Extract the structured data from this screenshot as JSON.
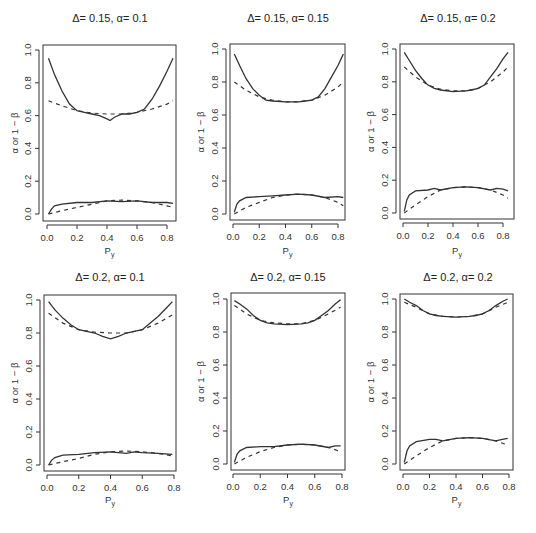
{
  "figure": {
    "layout": "2x3 grid of line plots",
    "line_color": "#333333",
    "background": "#ffffff"
  },
  "chart_data": [
    {
      "type": "line",
      "title": "Δ= 0.15, α= 0.1",
      "xlabel": "P_y",
      "ylabel": "α or 1 − β",
      "xlim": [
        0.0,
        0.85
      ],
      "ylim": [
        0.0,
        1.0
      ],
      "xticks": [
        "0.0",
        "0.2",
        "0.4",
        "0.6",
        "0.8"
      ],
      "yticks": [
        "0.0",
        "0.2",
        "0.4",
        "0.6",
        "0.8",
        "1.0"
      ],
      "grid": false,
      "series": [
        {
          "name": "power (solid)",
          "style": "solid",
          "x": [
            0.01,
            0.05,
            0.1,
            0.15,
            0.2,
            0.25,
            0.3,
            0.35,
            0.4,
            0.42,
            0.45,
            0.5,
            0.55,
            0.6,
            0.65,
            0.7,
            0.75,
            0.8,
            0.84
          ],
          "y": [
            0.95,
            0.85,
            0.75,
            0.67,
            0.63,
            0.62,
            0.61,
            0.6,
            0.58,
            0.57,
            0.59,
            0.61,
            0.61,
            0.62,
            0.64,
            0.7,
            0.78,
            0.87,
            0.95
          ]
        },
        {
          "name": "power (dashed)",
          "style": "dashed",
          "x": [
            0.01,
            0.1,
            0.2,
            0.3,
            0.4,
            0.5,
            0.6,
            0.7,
            0.8,
            0.84
          ],
          "y": [
            0.69,
            0.66,
            0.63,
            0.615,
            0.61,
            0.61,
            0.62,
            0.64,
            0.67,
            0.69
          ]
        },
        {
          "name": "type I error (solid)",
          "style": "solid",
          "x": [
            0.01,
            0.03,
            0.05,
            0.1,
            0.2,
            0.3,
            0.4,
            0.5,
            0.6,
            0.7,
            0.8,
            0.84
          ],
          "y": [
            0.0,
            0.03,
            0.05,
            0.06,
            0.07,
            0.07,
            0.08,
            0.075,
            0.08,
            0.07,
            0.07,
            0.065
          ]
        },
        {
          "name": "type I error (dashed)",
          "style": "dashed",
          "x": [
            0.01,
            0.1,
            0.2,
            0.3,
            0.4,
            0.5,
            0.6,
            0.7,
            0.8,
            0.84
          ],
          "y": [
            0.0,
            0.02,
            0.04,
            0.06,
            0.08,
            0.085,
            0.08,
            0.07,
            0.05,
            0.04
          ]
        }
      ]
    },
    {
      "type": "line",
      "title": "Δ= 0.15, α= 0.15",
      "xlabel": "P_y",
      "ylabel": "α or 1 − β",
      "xlim": [
        0.0,
        0.85
      ],
      "ylim": [
        0.0,
        1.0
      ],
      "xticks": [
        "0.0",
        "0.2",
        "0.4",
        "0.6",
        "0.8"
      ],
      "yticks": [
        "0.0",
        "0.2",
        "0.4",
        "0.6",
        "0.8",
        "1.0"
      ],
      "grid": false,
      "series": [
        {
          "name": "power (solid)",
          "style": "solid",
          "x": [
            0.01,
            0.05,
            0.1,
            0.15,
            0.2,
            0.25,
            0.3,
            0.4,
            0.5,
            0.55,
            0.6,
            0.65,
            0.7,
            0.75,
            0.8,
            0.84
          ],
          "y": [
            0.97,
            0.9,
            0.82,
            0.76,
            0.72,
            0.69,
            0.685,
            0.68,
            0.68,
            0.685,
            0.69,
            0.71,
            0.76,
            0.83,
            0.9,
            0.97
          ]
        },
        {
          "name": "power (dashed)",
          "style": "dashed",
          "x": [
            0.01,
            0.1,
            0.2,
            0.3,
            0.4,
            0.5,
            0.6,
            0.7,
            0.8,
            0.84
          ],
          "y": [
            0.8,
            0.75,
            0.71,
            0.69,
            0.68,
            0.68,
            0.69,
            0.72,
            0.77,
            0.8
          ]
        },
        {
          "name": "type I error (solid)",
          "style": "solid",
          "x": [
            0.01,
            0.03,
            0.05,
            0.1,
            0.2,
            0.3,
            0.4,
            0.5,
            0.6,
            0.7,
            0.8,
            0.84
          ],
          "y": [
            0.01,
            0.06,
            0.08,
            0.1,
            0.105,
            0.11,
            0.115,
            0.12,
            0.115,
            0.1,
            0.105,
            0.1
          ]
        },
        {
          "name": "type I error (dashed)",
          "style": "dashed",
          "x": [
            0.01,
            0.1,
            0.2,
            0.3,
            0.4,
            0.5,
            0.6,
            0.7,
            0.8,
            0.84
          ],
          "y": [
            0.0,
            0.04,
            0.07,
            0.1,
            0.115,
            0.12,
            0.115,
            0.1,
            0.07,
            0.05
          ]
        }
      ]
    },
    {
      "type": "line",
      "title": "Δ= 0.15, α= 0.2",
      "xlabel": "P_y",
      "ylabel": "α or 1 − β",
      "xlim": [
        0.0,
        0.85
      ],
      "ylim": [
        0.0,
        1.0
      ],
      "xticks": [
        "0.0",
        "0.2",
        "0.4",
        "0.6",
        "0.8"
      ],
      "yticks": [
        "0.0",
        "0.2",
        "0.4",
        "0.6",
        "0.8",
        "1.0"
      ],
      "grid": false,
      "series": [
        {
          "name": "power (solid)",
          "style": "solid",
          "x": [
            0.01,
            0.05,
            0.1,
            0.15,
            0.2,
            0.25,
            0.3,
            0.4,
            0.5,
            0.55,
            0.6,
            0.65,
            0.7,
            0.75,
            0.8,
            0.84
          ],
          "y": [
            0.98,
            0.93,
            0.87,
            0.82,
            0.78,
            0.76,
            0.75,
            0.74,
            0.745,
            0.75,
            0.76,
            0.78,
            0.83,
            0.88,
            0.94,
            0.98
          ]
        },
        {
          "name": "power (dashed)",
          "style": "dashed",
          "x": [
            0.01,
            0.1,
            0.2,
            0.3,
            0.4,
            0.5,
            0.6,
            0.7,
            0.8,
            0.84
          ],
          "y": [
            0.89,
            0.83,
            0.78,
            0.755,
            0.745,
            0.745,
            0.76,
            0.8,
            0.86,
            0.89
          ]
        },
        {
          "name": "type I error (solid)",
          "style": "solid",
          "x": [
            0.01,
            0.03,
            0.05,
            0.1,
            0.2,
            0.25,
            0.3,
            0.4,
            0.5,
            0.6,
            0.7,
            0.75,
            0.8,
            0.84
          ],
          "y": [
            0.01,
            0.08,
            0.11,
            0.135,
            0.14,
            0.15,
            0.14,
            0.155,
            0.16,
            0.155,
            0.14,
            0.15,
            0.145,
            0.135
          ]
        },
        {
          "name": "type I error (dashed)",
          "style": "dashed",
          "x": [
            0.01,
            0.1,
            0.2,
            0.3,
            0.4,
            0.5,
            0.6,
            0.7,
            0.8,
            0.84
          ],
          "y": [
            0.0,
            0.05,
            0.1,
            0.14,
            0.155,
            0.16,
            0.155,
            0.14,
            0.11,
            0.09
          ]
        }
      ]
    },
    {
      "type": "line",
      "title": "Δ= 0.2, α= 0.1",
      "xlabel": "P_y",
      "ylabel": "α or 1 − β",
      "xlim": [
        0.0,
        0.8
      ],
      "ylim": [
        0.0,
        1.0
      ],
      "xticks": [
        "0.0",
        "0.2",
        "0.4",
        "0.6",
        "0.8"
      ],
      "yticks": [
        "0.0",
        "0.2",
        "0.4",
        "0.6",
        "0.8",
        "1.0"
      ],
      "grid": false,
      "series": [
        {
          "name": "power (solid)",
          "style": "solid",
          "x": [
            0.01,
            0.05,
            0.1,
            0.15,
            0.2,
            0.25,
            0.3,
            0.35,
            0.4,
            0.45,
            0.5,
            0.55,
            0.6,
            0.65,
            0.7,
            0.75,
            0.79
          ],
          "y": [
            0.99,
            0.94,
            0.89,
            0.85,
            0.82,
            0.81,
            0.8,
            0.78,
            0.765,
            0.78,
            0.8,
            0.81,
            0.82,
            0.86,
            0.9,
            0.95,
            0.99
          ]
        },
        {
          "name": "power (dashed)",
          "style": "dashed",
          "x": [
            0.01,
            0.1,
            0.2,
            0.3,
            0.4,
            0.5,
            0.6,
            0.7,
            0.79
          ],
          "y": [
            0.92,
            0.86,
            0.82,
            0.805,
            0.8,
            0.8,
            0.82,
            0.86,
            0.91
          ]
        },
        {
          "name": "type I error (solid)",
          "style": "solid",
          "x": [
            0.01,
            0.03,
            0.05,
            0.1,
            0.2,
            0.3,
            0.4,
            0.5,
            0.55,
            0.6,
            0.7,
            0.79
          ],
          "y": [
            0.0,
            0.03,
            0.045,
            0.06,
            0.065,
            0.075,
            0.08,
            0.07,
            0.08,
            0.075,
            0.07,
            0.065
          ]
        },
        {
          "name": "type I error (dashed)",
          "style": "dashed",
          "x": [
            0.01,
            0.1,
            0.2,
            0.3,
            0.4,
            0.5,
            0.6,
            0.7,
            0.79
          ],
          "y": [
            0.0,
            0.02,
            0.04,
            0.065,
            0.08,
            0.085,
            0.08,
            0.07,
            0.055
          ]
        }
      ]
    },
    {
      "type": "line",
      "title": "Δ= 0.2, α= 0.15",
      "xlabel": "P_y",
      "ylabel": "α or 1 − β",
      "xlim": [
        0.0,
        0.8
      ],
      "ylim": [
        0.0,
        1.0
      ],
      "xticks": [
        "0.0",
        "0.2",
        "0.4",
        "0.6",
        "0.8"
      ],
      "yticks": [
        "0.0",
        "0.2",
        "0.4",
        "0.6",
        "0.8",
        "1.0"
      ],
      "grid": false,
      "series": [
        {
          "name": "power (solid)",
          "style": "solid",
          "x": [
            0.01,
            0.05,
            0.1,
            0.15,
            0.2,
            0.25,
            0.3,
            0.4,
            0.5,
            0.55,
            0.6,
            0.65,
            0.7,
            0.75,
            0.79
          ],
          "y": [
            0.99,
            0.97,
            0.94,
            0.9,
            0.87,
            0.855,
            0.85,
            0.845,
            0.85,
            0.855,
            0.87,
            0.9,
            0.93,
            0.97,
            0.995
          ]
        },
        {
          "name": "power (dashed)",
          "style": "dashed",
          "x": [
            0.01,
            0.1,
            0.2,
            0.3,
            0.4,
            0.5,
            0.6,
            0.7,
            0.79
          ],
          "y": [
            0.96,
            0.91,
            0.87,
            0.855,
            0.85,
            0.85,
            0.87,
            0.91,
            0.95
          ]
        },
        {
          "name": "type I error (solid)",
          "style": "solid",
          "x": [
            0.01,
            0.03,
            0.05,
            0.1,
            0.2,
            0.3,
            0.4,
            0.5,
            0.6,
            0.7,
            0.75,
            0.79
          ],
          "y": [
            0.01,
            0.06,
            0.08,
            0.1,
            0.105,
            0.105,
            0.115,
            0.12,
            0.115,
            0.1,
            0.11,
            0.11
          ]
        },
        {
          "name": "type I error (dashed)",
          "style": "dashed",
          "x": [
            0.01,
            0.1,
            0.2,
            0.3,
            0.4,
            0.5,
            0.6,
            0.7,
            0.79
          ],
          "y": [
            0.0,
            0.04,
            0.075,
            0.1,
            0.115,
            0.12,
            0.115,
            0.1,
            0.075
          ]
        }
      ]
    },
    {
      "type": "line",
      "title": "Δ= 0.2, α= 0.2",
      "xlabel": "P_y",
      "ylabel": "α or 1 − β",
      "xlim": [
        0.0,
        0.8
      ],
      "ylim": [
        0.0,
        1.0
      ],
      "xticks": [
        "0.0",
        "0.2",
        "0.4",
        "0.6",
        "0.8"
      ],
      "yticks": [
        "0.0",
        "0.2",
        "0.4",
        "0.6",
        "0.8",
        "1.0"
      ],
      "grid": false,
      "series": [
        {
          "name": "power (solid)",
          "style": "solid",
          "x": [
            0.01,
            0.05,
            0.1,
            0.15,
            0.2,
            0.25,
            0.3,
            0.4,
            0.5,
            0.55,
            0.6,
            0.65,
            0.7,
            0.75,
            0.79
          ],
          "y": [
            1.0,
            0.98,
            0.96,
            0.93,
            0.91,
            0.9,
            0.895,
            0.89,
            0.895,
            0.9,
            0.91,
            0.93,
            0.96,
            0.985,
            1.0
          ]
        },
        {
          "name": "power (dashed)",
          "style": "dashed",
          "x": [
            0.01,
            0.1,
            0.2,
            0.3,
            0.4,
            0.5,
            0.6,
            0.7,
            0.79
          ],
          "y": [
            0.98,
            0.95,
            0.91,
            0.895,
            0.89,
            0.895,
            0.91,
            0.95,
            0.98
          ]
        },
        {
          "name": "type I error (solid)",
          "style": "solid",
          "x": [
            0.01,
            0.03,
            0.05,
            0.1,
            0.2,
            0.25,
            0.3,
            0.4,
            0.5,
            0.6,
            0.7,
            0.75,
            0.79
          ],
          "y": [
            0.01,
            0.08,
            0.11,
            0.135,
            0.15,
            0.15,
            0.14,
            0.155,
            0.16,
            0.155,
            0.14,
            0.15,
            0.155
          ]
        },
        {
          "name": "type I error (dashed)",
          "style": "dashed",
          "x": [
            0.01,
            0.1,
            0.2,
            0.3,
            0.4,
            0.5,
            0.6,
            0.7,
            0.79
          ],
          "y": [
            0.0,
            0.05,
            0.1,
            0.14,
            0.155,
            0.16,
            0.155,
            0.14,
            0.115
          ]
        }
      ]
    }
  ],
  "panels_layout": [
    {
      "frame": [
        43,
        45,
        176,
        221
      ],
      "x0": 47,
      "x08": 167,
      "y0": 214,
      "y1": 50,
      "title_xy": [
        110,
        22
      ],
      "ylab_x": 18,
      "xlab_y": 254
    },
    {
      "frame": [
        230,
        44,
        345,
        220
      ],
      "x0": 233,
      "x08": 338,
      "y0": 214,
      "y1": 49,
      "title_xy": [
        288,
        22
      ],
      "ylab_x": 204,
      "xlab_y": 254
    },
    {
      "frame": [
        400,
        44,
        514,
        219
      ],
      "x0": 403,
      "x08": 503,
      "y0": 213,
      "y1": 49,
      "title_xy": [
        458,
        22
      ],
      "ylab_x": 374,
      "xlab_y": 254
    },
    {
      "frame": [
        44,
        295,
        176,
        471
      ],
      "x0": 47,
      "x08": 174,
      "y0": 465,
      "y1": 300,
      "title_xy": [
        110,
        281
      ],
      "ylab_x": 18,
      "xlab_y": 503
    },
    {
      "frame": [
        231,
        293,
        345,
        470
      ],
      "x0": 233,
      "x08": 342,
      "y0": 464,
      "y1": 299,
      "title_xy": [
        288,
        281
      ],
      "ylab_x": 204,
      "xlab_y": 503
    },
    {
      "frame": [
        400,
        294,
        513,
        470
      ],
      "x0": 403,
      "x08": 509,
      "y0": 464,
      "y1": 299,
      "title_xy": [
        458,
        281
      ],
      "ylab_x": 374,
      "xlab_y": 503
    }
  ]
}
